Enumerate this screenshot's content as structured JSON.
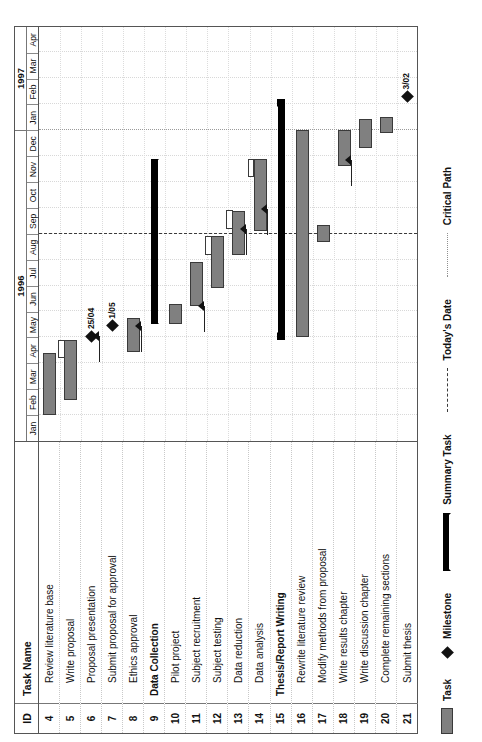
{
  "chart_data": {
    "type": "gantt",
    "timescale": {
      "years": [
        {
          "label": "1996",
          "months": 12
        },
        {
          "label": "1997",
          "months": 4
        }
      ],
      "months": [
        "Jan",
        "Feb",
        "Mar",
        "Apr",
        "May",
        "Jun",
        "Jul",
        "Aug",
        "Sep",
        "Oct",
        "Nov",
        "Dec",
        "Jan",
        "Feb",
        "Mar",
        "Apr"
      ],
      "unit_count": 16,
      "start": "1996-01",
      "end": "1997-04"
    },
    "columns": [
      "ID",
      "Task Name"
    ],
    "markers": {
      "todays_date": {
        "label": "Today's Date",
        "month_index": 8.0
      },
      "critical_path": {
        "label": "Critical Path",
        "month_index": 12.0
      }
    },
    "tasks": [
      {
        "id": "4",
        "name": "Review literature base",
        "level": 2,
        "type": "task",
        "start": 1.0,
        "end": 3.4,
        "slip": null
      },
      {
        "id": "5",
        "name": "Write proposal",
        "level": 2,
        "type": "task",
        "start": 1.6,
        "end": 3.9,
        "slip": {
          "start": 3.2,
          "end": 3.9
        }
      },
      {
        "id": "6",
        "name": "Proposal presentation",
        "level": 2,
        "type": "milestone",
        "at": 4.05,
        "label": "25/04"
      },
      {
        "id": "7",
        "name": "Submit proposal for approval",
        "level": 2,
        "type": "milestone",
        "at": 4.45,
        "label": "1/05"
      },
      {
        "id": "8",
        "name": "Ethics approval",
        "level": 2,
        "type": "task",
        "start": 3.45,
        "end": 4.75,
        "slip": null
      },
      {
        "id": "9",
        "name": "Data Collection",
        "level": 1,
        "type": "summary",
        "start": 4.5,
        "end": 10.9,
        "slip": null
      },
      {
        "id": "10",
        "name": "Pilot project",
        "level": 2,
        "type": "task",
        "start": 4.5,
        "end": 5.3,
        "slip": null
      },
      {
        "id": "11",
        "name": "Subject recruitment",
        "level": 2,
        "type": "task",
        "start": 5.2,
        "end": 6.9,
        "slip": null
      },
      {
        "id": "12",
        "name": "Subject testing",
        "level": 2,
        "type": "task",
        "start": 5.9,
        "end": 7.9,
        "slip": {
          "start": 7.2,
          "end": 7.9
        }
      },
      {
        "id": "13",
        "name": "Data reduction",
        "level": 2,
        "type": "task",
        "start": 7.2,
        "end": 8.9,
        "slip": {
          "start": 8.2,
          "end": 8.9
        }
      },
      {
        "id": "14",
        "name": "Data analysis",
        "level": 2,
        "type": "task",
        "start": 8.1,
        "end": 10.9,
        "slip": {
          "start": 10.2,
          "end": 10.9
        }
      },
      {
        "id": "15",
        "name": "Thesis/Report Writing",
        "level": 1,
        "type": "summary",
        "start": 3.9,
        "end": 13.2,
        "slip": null
      },
      {
        "id": "16",
        "name": "Rewrite literature review",
        "level": 2,
        "type": "task",
        "start": 4.0,
        "end": 12.0,
        "slip": null
      },
      {
        "id": "17",
        "name": "Modify methods from proposal",
        "level": 2,
        "type": "task",
        "start": 7.7,
        "end": 8.35,
        "slip": null
      },
      {
        "id": "18",
        "name": "Write results chapter",
        "level": 2,
        "type": "task",
        "start": 10.6,
        "end": 12.0,
        "slip": null
      },
      {
        "id": "19",
        "name": "Write discussion chapter",
        "level": 2,
        "type": "task",
        "start": 11.3,
        "end": 12.45,
        "slip": null
      },
      {
        "id": "20",
        "name": "Complete remaining sections",
        "level": 2,
        "type": "task",
        "start": 11.9,
        "end": 12.5,
        "slip": null
      },
      {
        "id": "21",
        "name": "Submit thesis",
        "level": 2,
        "type": "milestone",
        "at": 13.3,
        "label": "3/02"
      }
    ],
    "links": [
      {
        "from_row": 1,
        "to_row": 2,
        "at": 4.05
      },
      {
        "from_row": 3,
        "to_row": 4,
        "at": 4.45
      },
      {
        "from_row": 6,
        "to_row": 7,
        "at": 5.2
      },
      {
        "from_row": 8,
        "to_row": 9,
        "at": 8.2
      },
      {
        "from_row": 9,
        "to_row": 10,
        "at": 8.95
      },
      {
        "from_row": 10,
        "to_row": 14,
        "at": 10.85
      }
    ]
  },
  "legend": {
    "task_label": "Task",
    "milestone_label": "Milestone",
    "summary_label": "Summary Task",
    "today_label": "Today's Date",
    "critical_label": "Critical Path"
  },
  "colors": {
    "task_fill": "#808080",
    "task_border": "#3a3a3a",
    "summary_fill": "#000000",
    "milestone_fill": "#111111",
    "today_line": "#3b3b3b",
    "critical_line": "#9a9a9a",
    "grid": "#d8d8d8"
  }
}
